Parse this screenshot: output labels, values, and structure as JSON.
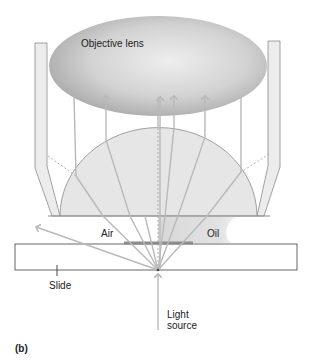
{
  "figure": {
    "panel_label": "(b)",
    "labels": {
      "objective_lens": "Objective lens",
      "air": "Air",
      "oil": "Oil",
      "slide": "Slide",
      "light_line1": "Light",
      "light_line2": "source"
    },
    "colors": {
      "lens_fill": "#b8b8b8",
      "hemisphere_fill": "#e6e6e6",
      "ray": "#b9b9b9",
      "outline": "#8a8a8a",
      "oil_fill": "#dcdcdc",
      "specimen": "#8c8c8c"
    }
  }
}
